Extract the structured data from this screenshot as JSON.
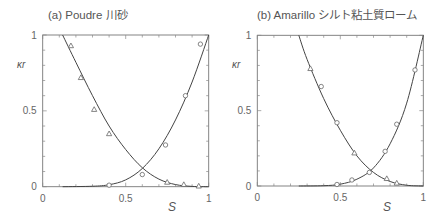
{
  "figure": {
    "panels": [
      {
        "title": "(a)  Poudre 川砂",
        "ylabel": "κr",
        "xlabel": "S"
      },
      {
        "title": "(b)  Amarillo シルト粘土質ローム",
        "ylabel": "κr",
        "xlabel": "S"
      }
    ]
  },
  "chart_data": [
    {
      "type": "scatter",
      "title": "(a)  Poudre 川砂",
      "xlabel": "S",
      "ylabel": "κr",
      "xlim": [
        0,
        1
      ],
      "ylim": [
        0,
        1
      ],
      "xticks": [
        "0",
        "0.5",
        "1"
      ],
      "yticks": [
        "0",
        "0.5",
        "1"
      ],
      "grid": false,
      "series": [
        {
          "name": "triangles (decreasing κr)",
          "marker": "triangle",
          "x": [
            0.17,
            0.23,
            0.31,
            0.4,
            0.75,
            0.85,
            0.94
          ],
          "y": [
            0.93,
            0.72,
            0.51,
            0.35,
            0.03,
            0.015,
            0.005
          ]
        },
        {
          "name": "circles (increasing κr)",
          "marker": "circle",
          "x": [
            0.4,
            0.6,
            0.74,
            0.86,
            0.95
          ],
          "y": [
            0.01,
            0.08,
            0.275,
            0.6,
            0.94
          ]
        },
        {
          "name": "fitted curve (decreasing)",
          "marker": "line",
          "x": [
            0.12,
            0.2,
            0.3,
            0.4,
            0.5,
            0.6,
            0.7,
            0.8,
            0.9,
            1.0
          ],
          "y": [
            1.0,
            0.82,
            0.6,
            0.4,
            0.245,
            0.125,
            0.05,
            0.014,
            0.002,
            0.0
          ]
        },
        {
          "name": "fitted curve (increasing)",
          "marker": "line",
          "x": [
            0.12,
            0.3,
            0.4,
            0.5,
            0.6,
            0.7,
            0.8,
            0.9,
            1.0
          ],
          "y": [
            0.0,
            0.003,
            0.013,
            0.045,
            0.12,
            0.25,
            0.44,
            0.69,
            1.0
          ]
        }
      ]
    },
    {
      "type": "scatter",
      "title": "(b)  Amarillo シルト粘土質ローム",
      "xlabel": "S",
      "ylabel": "κr",
      "xlim": [
        0,
        1
      ],
      "ylim": [
        0,
        1
      ],
      "xticks": [
        "0",
        "0.5",
        "1"
      ],
      "yticks": [
        "0",
        "0.5",
        "1"
      ],
      "grid": false,
      "series": [
        {
          "name": "triangles (decreasing κr)",
          "marker": "triangle",
          "x": [
            0.32,
            0.585,
            0.78,
            0.84
          ],
          "y": [
            0.78,
            0.22,
            0.05,
            0.02
          ]
        },
        {
          "name": "circles",
          "marker": "circle",
          "x": [
            0.385,
            0.48,
            0.675,
            0.48,
            0.57,
            0.77,
            0.84,
            0.95
          ],
          "y": [
            0.66,
            0.42,
            0.09,
            0.01,
            0.04,
            0.23,
            0.41,
            0.77
          ]
        },
        {
          "name": "fitted curve (decreasing)",
          "marker": "line",
          "x": [
            0.25,
            0.3,
            0.4,
            0.5,
            0.6,
            0.7,
            0.8,
            0.9,
            1.0
          ],
          "y": [
            1.0,
            0.84,
            0.58,
            0.37,
            0.2,
            0.09,
            0.03,
            0.005,
            0.0
          ]
        },
        {
          "name": "fitted curve (increasing)",
          "marker": "line",
          "x": [
            0.25,
            0.4,
            0.5,
            0.6,
            0.7,
            0.8,
            0.9,
            1.0
          ],
          "y": [
            0.0,
            0.002,
            0.012,
            0.045,
            0.12,
            0.28,
            0.55,
            1.0
          ]
        }
      ]
    }
  ]
}
